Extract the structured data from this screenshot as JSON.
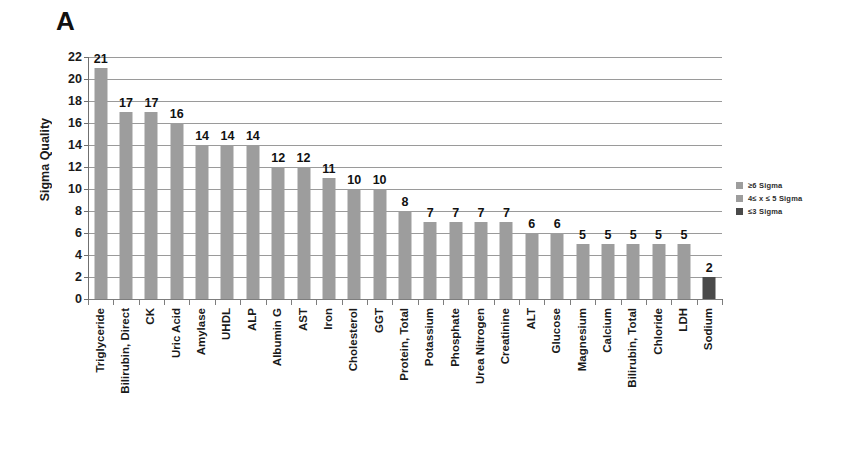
{
  "panel": {
    "label": "A"
  },
  "legend": {
    "position": "right",
    "items": [
      {
        "label": "≥6 Sigma",
        "color": "#9d9d9d"
      },
      {
        "label": "4≤ x ≤ 5 Sigma",
        "color": "#9d9d9d"
      },
      {
        "label": "≤3 Sigma",
        "color": "#4a4a4a"
      }
    ]
  },
  "chart_data": {
    "type": "bar",
    "title": "",
    "xlabel": "",
    "ylabel": "Sigma Quality",
    "ylim": [
      0,
      22
    ],
    "ytick_step": 2,
    "yticks": [
      0,
      2,
      4,
      6,
      8,
      10,
      12,
      14,
      16,
      18,
      20,
      22
    ],
    "grid": true,
    "legend_position": "right",
    "categories": [
      "Triglyceride",
      "Bilirubin, Direct",
      "CK",
      "Uric Acid",
      "Amylase",
      "UHDL",
      "ALP",
      "Albumin G",
      "AST",
      "Iron",
      "Cholesterol",
      "GGT",
      "Protein, Total",
      "Potassium",
      "Phosphate",
      "Urea Nitrogen",
      "Creatinine",
      "ALT",
      "Glucose",
      "Magnesium",
      "Calcium",
      "Bilirubin, Total",
      "Chloride",
      "LDH",
      "Sodium"
    ],
    "values": [
      21,
      17,
      17,
      16,
      14,
      14,
      14,
      12,
      12,
      11,
      10,
      10,
      8,
      7,
      7,
      7,
      7,
      6,
      6,
      5,
      5,
      5,
      5,
      5,
      2
    ],
    "levels": [
      "high",
      "high",
      "high",
      "high",
      "high",
      "high",
      "high",
      "high",
      "high",
      "high",
      "high",
      "high",
      "high",
      "high",
      "high",
      "high",
      "high",
      "high",
      "high",
      "mid",
      "mid",
      "mid",
      "mid",
      "mid",
      "low"
    ]
  }
}
